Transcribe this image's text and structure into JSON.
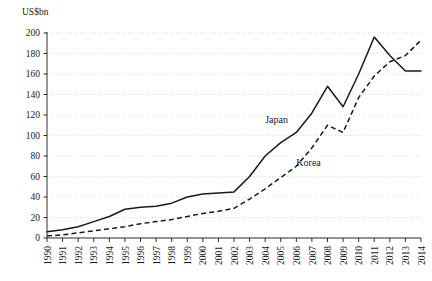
{
  "chart_data": {
    "type": "line",
    "title": "",
    "subtitle": "",
    "xlabel": "",
    "ylabel": "US$bn",
    "unit_label": "US$bn",
    "grid": true,
    "legend_position": "inline-annotation",
    "ylim": [
      0,
      200
    ],
    "yticks": [
      0,
      20,
      40,
      60,
      80,
      100,
      120,
      140,
      160,
      180,
      200
    ],
    "ytick_labels": [
      "0",
      "20",
      "40",
      "60",
      "80",
      "100",
      "120",
      "140",
      "160",
      "180",
      "200"
    ],
    "categories": [
      "1990",
      "1991",
      "1992",
      "1993",
      "1994",
      "1995",
      "1996",
      "1997",
      "1998",
      "1999",
      "2000",
      "2001",
      "2002",
      "2003",
      "2004",
      "2005",
      "2006",
      "2007",
      "2008",
      "2009",
      "2010",
      "2011",
      "2012",
      "2013",
      "2014"
    ],
    "x": [
      1990,
      1991,
      1992,
      1993,
      1994,
      1995,
      1996,
      1997,
      1998,
      1999,
      2000,
      2001,
      2002,
      2003,
      2004,
      2005,
      2006,
      2007,
      2008,
      2009,
      2010,
      2011,
      2012,
      2013,
      2014
    ],
    "series": [
      {
        "name": "Japan",
        "style": "solid",
        "annotation": "Japan",
        "values": [
          6,
          8,
          11,
          16,
          21,
          28,
          30,
          31,
          34,
          40,
          43,
          44,
          45,
          60,
          80,
          93,
          103,
          122,
          148,
          128,
          160,
          196,
          178,
          163,
          163
        ]
      },
      {
        "name": "Korea",
        "style": "dashed",
        "annotation": "Korea",
        "values": [
          2,
          3,
          5,
          7,
          9,
          11,
          14,
          16,
          18,
          21,
          24,
          26,
          29,
          38,
          48,
          59,
          70,
          88,
          110,
          103,
          137,
          158,
          172,
          178,
          193
        ]
      }
    ],
    "annotations": [
      {
        "text": "Japan",
        "x": 2004,
        "y": 112
      },
      {
        "text": "Korea",
        "x": 2006,
        "y": 70
      }
    ],
    "colors": {
      "line": "#1a1a1a",
      "grid": "#c8c8c8",
      "background": "#ffffff"
    }
  }
}
